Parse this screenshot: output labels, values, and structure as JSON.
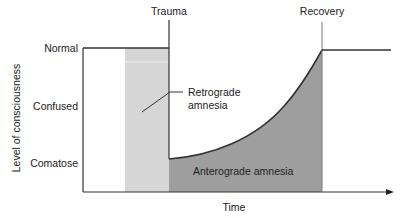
{
  "diagram": {
    "events": {
      "trauma": "Trauma",
      "recovery": "Recovery"
    },
    "y_axis": {
      "label": "Level of consciousness",
      "levels": [
        "Normal",
        "Confused",
        "Comatose"
      ]
    },
    "x_axis": {
      "label": "Time"
    },
    "regions": {
      "retrograde": "Retrograde amnesia",
      "retrograde_line1": "Retrograde",
      "retrograde_line2": "amnesia",
      "anterograde": "Anterograde amnesia"
    },
    "colors": {
      "retrograde_fill": "#d6d6d6",
      "anterograde_fill": "#9e9e9e",
      "line": "#333333"
    }
  }
}
